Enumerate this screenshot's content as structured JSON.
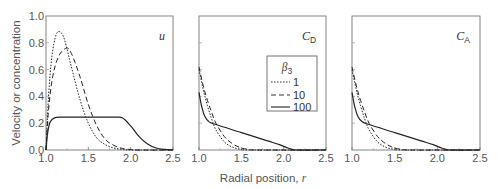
{
  "figure": {
    "ylabel": "Velocity or concentration",
    "xlabel_text": "Radial position, ",
    "xlabel_var": "r"
  },
  "legend": {
    "title_symbol": "β",
    "title_sub": "3",
    "entries": [
      {
        "label": "1",
        "style": "dotted"
      },
      {
        "label": "10",
        "style": "dashed"
      },
      {
        "label": "100",
        "style": "solid"
      }
    ]
  },
  "chart_data": [
    {
      "type": "line",
      "panel": "u",
      "label_main": "u",
      "label_sub": "",
      "xlabel": "",
      "ylabel": "Velocity or concentration",
      "xlim": [
        1.0,
        2.5
      ],
      "ylim": [
        0.0,
        1.0
      ],
      "xticks": [
        "1.0",
        "1.5",
        "2.0",
        "2.5"
      ],
      "yticks": [
        "0.0",
        "0.2",
        "0.4",
        "0.6",
        "0.8",
        "1.0"
      ],
      "grid": false,
      "series": [
        {
          "name": "1",
          "style": "dotted",
          "x": [
            1.0,
            1.03,
            1.07,
            1.12,
            1.17,
            1.22,
            1.3,
            1.4,
            1.5,
            1.6,
            1.7,
            1.8,
            1.9,
            2.0,
            2.5
          ],
          "y": [
            0.0,
            0.4,
            0.7,
            0.86,
            0.88,
            0.82,
            0.62,
            0.38,
            0.2,
            0.09,
            0.04,
            0.015,
            0.005,
            0.0,
            0.0
          ]
        },
        {
          "name": "10",
          "style": "dashed",
          "x": [
            1.0,
            1.03,
            1.08,
            1.15,
            1.24,
            1.3,
            1.4,
            1.5,
            1.6,
            1.7,
            1.8,
            1.9,
            2.0,
            2.1,
            2.5
          ],
          "y": [
            0.0,
            0.3,
            0.55,
            0.7,
            0.76,
            0.72,
            0.55,
            0.34,
            0.18,
            0.08,
            0.035,
            0.012,
            0.004,
            0.0,
            0.0
          ]
        },
        {
          "name": "100",
          "style": "solid",
          "x": [
            1.0,
            1.02,
            1.05,
            1.1,
            1.2,
            1.5,
            1.8,
            1.9,
            2.0,
            2.1,
            2.2,
            2.3,
            2.4,
            2.5
          ],
          "y": [
            0.0,
            0.13,
            0.21,
            0.24,
            0.245,
            0.245,
            0.245,
            0.24,
            0.18,
            0.1,
            0.045,
            0.015,
            0.004,
            0.0
          ]
        }
      ]
    },
    {
      "type": "line",
      "panel": "C_D",
      "label_main": "C",
      "label_sub": "D",
      "xlabel": "Radial position, r",
      "xlim": [
        1.0,
        2.5
      ],
      "ylim": [
        0.0,
        1.0
      ],
      "xticks": [
        "1.0",
        "1.5",
        "2.0",
        "2.5"
      ],
      "grid": false,
      "series": [
        {
          "name": "1",
          "style": "dotted",
          "x": [
            1.0,
            1.05,
            1.1,
            1.15,
            1.2,
            1.3,
            1.4,
            1.5,
            1.6,
            2.5
          ],
          "y": [
            0.6,
            0.45,
            0.33,
            0.23,
            0.15,
            0.06,
            0.02,
            0.005,
            0.0,
            0.0
          ]
        },
        {
          "name": "10",
          "style": "dashed",
          "x": [
            1.0,
            1.05,
            1.1,
            1.15,
            1.2,
            1.3,
            1.4,
            1.5,
            1.6,
            1.7,
            2.5
          ],
          "y": [
            0.62,
            0.48,
            0.37,
            0.28,
            0.2,
            0.1,
            0.045,
            0.015,
            0.004,
            0.0,
            0.0
          ]
        },
        {
          "name": "100",
          "style": "solid",
          "x": [
            1.0,
            1.03,
            1.07,
            1.12,
            1.2,
            1.5,
            1.8,
            1.95,
            2.05,
            2.1,
            2.15,
            2.5
          ],
          "y": [
            0.43,
            0.33,
            0.25,
            0.21,
            0.19,
            0.13,
            0.07,
            0.04,
            0.015,
            0.005,
            0.0,
            0.0
          ]
        }
      ]
    },
    {
      "type": "line",
      "panel": "C_A",
      "label_main": "C",
      "label_sub": "A",
      "xlabel": "",
      "xlim": [
        1.0,
        2.5
      ],
      "ylim": [
        0.0,
        1.0
      ],
      "xticks": [
        "1.0",
        "1.5",
        "2.0",
        "2.5"
      ],
      "grid": false,
      "series": [
        {
          "name": "1",
          "style": "dotted",
          "x": [
            1.0,
            1.05,
            1.1,
            1.15,
            1.2,
            1.3,
            1.4,
            1.5,
            1.6,
            2.5
          ],
          "y": [
            0.6,
            0.45,
            0.33,
            0.23,
            0.15,
            0.06,
            0.02,
            0.005,
            0.0,
            0.0
          ]
        },
        {
          "name": "10",
          "style": "dashed",
          "x": [
            1.0,
            1.05,
            1.1,
            1.15,
            1.2,
            1.3,
            1.4,
            1.5,
            1.6,
            1.7,
            2.5
          ],
          "y": [
            0.62,
            0.48,
            0.37,
            0.28,
            0.2,
            0.1,
            0.045,
            0.015,
            0.004,
            0.0,
            0.0
          ]
        },
        {
          "name": "100",
          "style": "solid",
          "x": [
            1.0,
            1.03,
            1.07,
            1.12,
            1.2,
            1.5,
            1.8,
            1.95,
            2.05,
            2.1,
            2.15,
            2.5
          ],
          "y": [
            0.43,
            0.33,
            0.25,
            0.21,
            0.19,
            0.13,
            0.07,
            0.04,
            0.015,
            0.005,
            0.0,
            0.0
          ]
        }
      ]
    }
  ]
}
